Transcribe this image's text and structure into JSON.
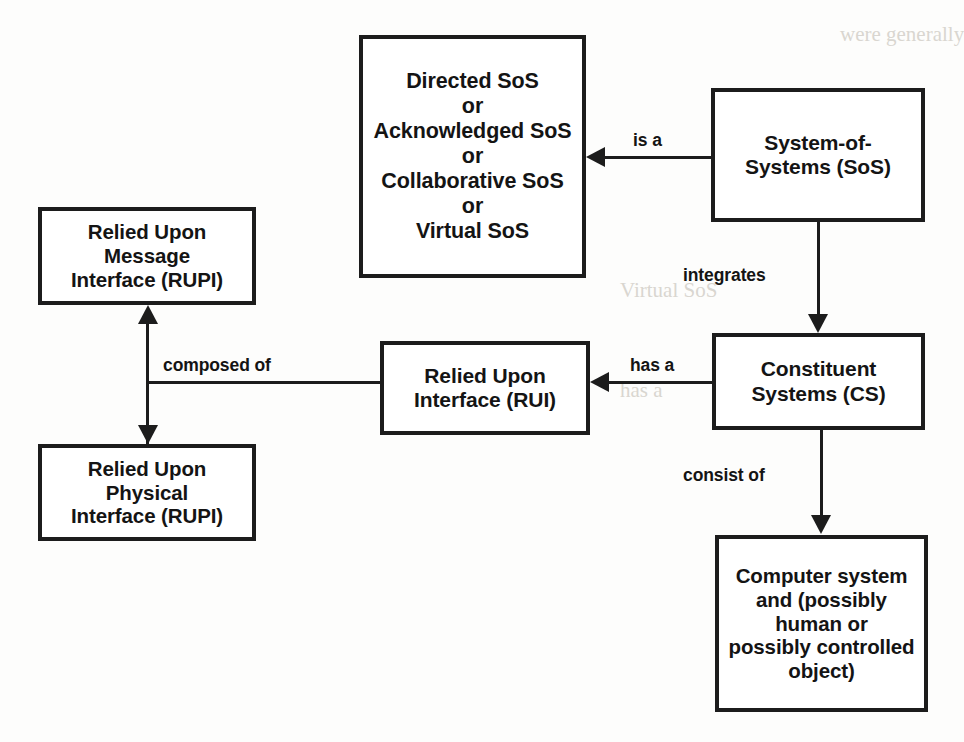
{
  "diagram": {
    "type": "concept-relationship-diagram",
    "colors": {
      "box_border": "#1c1c1c",
      "box_fill": "#ffffff",
      "text": "#141414",
      "page_background": "#fdfdfc"
    },
    "nodes": [
      {
        "id": "sos-types",
        "label": "Directed SoS\nor\nAcknowledged SoS\nor\nCollaborative SoS\nor\nVirtual SoS"
      },
      {
        "id": "sos",
        "label": "System-of-\nSystems (SoS)"
      },
      {
        "id": "rumi",
        "label": "Relied Upon\nMessage\nInterface (RUPI)"
      },
      {
        "id": "rui",
        "label": "Relied Upon\nInterface (RUI)"
      },
      {
        "id": "cs",
        "label": "Constituent\nSystems (CS)"
      },
      {
        "id": "rupi",
        "label": "Relied Upon\nPhysical\nInterface (RUPI)"
      },
      {
        "id": "computer",
        "label": "Computer system\nand (possibly\nhuman or\npossibly controlled\nobject)"
      }
    ],
    "edges": [
      {
        "id": "is-a",
        "label": "is a",
        "from": "sos",
        "to": "sos-types",
        "direction": "left"
      },
      {
        "id": "integrates",
        "label": "integrates",
        "from": "sos",
        "to": "cs",
        "direction": "down"
      },
      {
        "id": "has-a",
        "label": "has a",
        "from": "cs",
        "to": "rui",
        "direction": "left"
      },
      {
        "id": "consist-of",
        "label": "consist of",
        "from": "cs",
        "to": "computer",
        "direction": "down"
      },
      {
        "id": "composed-of",
        "label": "composed of",
        "from": "rui",
        "to": "rumi-rupi",
        "direction": "up-and-down"
      }
    ],
    "ghost_text": [
      {
        "id": "ghost-1",
        "text": "were generally"
      },
      {
        "id": "ghost-2",
        "text": "Virtual SoS"
      },
      {
        "id": "ghost-3",
        "text": "has a"
      }
    ]
  }
}
